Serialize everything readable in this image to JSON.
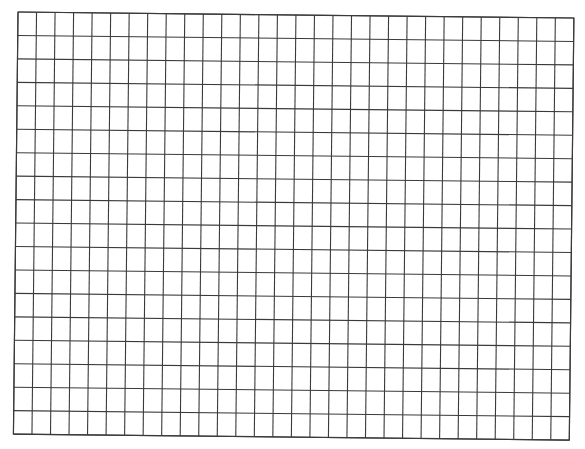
{
  "page": {
    "type": "graph-paper-grid",
    "background_color": "#ffffff",
    "line_color": "#3a3a3a"
  },
  "grid": {
    "columns": 30,
    "rows": 18,
    "origin_x": 18,
    "origin_y": 12,
    "cell_width": 18.53,
    "cell_height": 23.45,
    "rotation_deg": 0.62
  }
}
